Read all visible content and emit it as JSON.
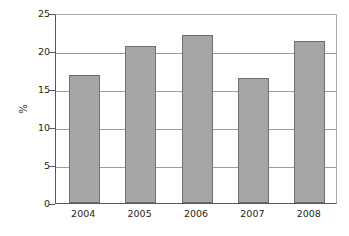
{
  "chart_data": {
    "type": "bar",
    "title": "",
    "subtitle": "",
    "xlabel": "",
    "ylabel": "%",
    "categories": [
      "2004",
      "2005",
      "2006",
      "2007",
      "2008"
    ],
    "values": [
      16.8,
      20.7,
      22.1,
      16.4,
      21.3
    ],
    "series": [
      {
        "name": "",
        "values": [
          16.8,
          20.7,
          22.1,
          16.4,
          21.3
        ]
      }
    ],
    "ylim": [
      0,
      25
    ],
    "y_ticks": [
      0,
      5,
      10,
      15,
      20,
      25
    ],
    "y_tick_labels": [
      "0",
      "5",
      "10",
      "15",
      "20",
      "25"
    ],
    "x_tick_labels": [
      "2004",
      "2005",
      "2006",
      "2007",
      "2008"
    ],
    "grid": true,
    "grid_axis": "y",
    "legend": false,
    "legend_position": "none",
    "annotations": [],
    "colors": {
      "bar_fill": "#a6a6a6",
      "bar_border": "#6d6e70",
      "gridline": "#9a9c9e",
      "axis": "#58595b",
      "text": "#231f20",
      "background": "#ffffff"
    }
  }
}
